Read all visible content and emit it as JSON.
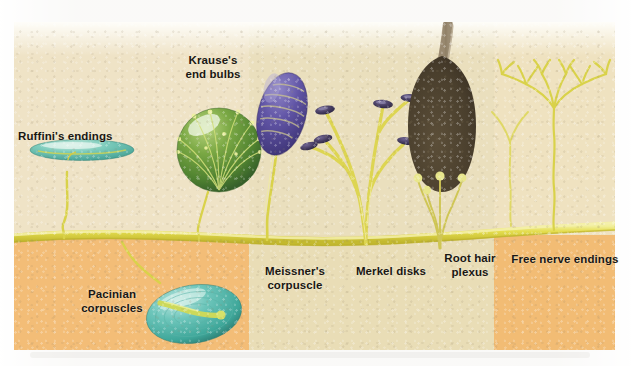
{
  "figure": {
    "colors": {
      "skin_upper_light": "#f0e4c6",
      "skin_upper_mid": "#e9dcb6",
      "skin_lower_orange": "#f2bd78",
      "skin_lower_cream": "#e8dcb4",
      "nerve_yellow": "#e2db4e",
      "nerve_yellow_light": "#ecea8a",
      "ruffini_teal": "#6fc3b4",
      "krause_green": "#5d8f34",
      "meissner_purple": "#5b4f9e",
      "merkel_disk": "#4a4166",
      "hair_brown": "#4b4030",
      "pacinian_teal": "#5cbcb0",
      "label_text": "#1a1713"
    },
    "bands": [
      {
        "name": "band-upper-left",
        "x": 0,
        "width": 235,
        "fill": "#efe3c6"
      },
      {
        "name": "band-upper-mid",
        "x": 235,
        "width": 245,
        "fill": "#eadfbd"
      },
      {
        "name": "band-upper-right",
        "x": 480,
        "width": 121,
        "fill": "#efe2c0"
      },
      {
        "name": "band-lower-orange-l",
        "x": 0,
        "width": 235,
        "fill": "#f3bd77"
      },
      {
        "name": "band-lower-cream",
        "x": 235,
        "width": 245,
        "fill": "#e9ddb6"
      },
      {
        "name": "band-lower-orange-r",
        "x": 480,
        "width": 121,
        "fill": "#f2bc74"
      }
    ],
    "labels": [
      {
        "id": "ruffini",
        "text": "Ruffini's endings",
        "x": 4,
        "y": 108,
        "width": 120,
        "align": "left"
      },
      {
        "id": "krause",
        "text": "Krause's\nend bulbs",
        "x": 152,
        "y": 36,
        "width": 110,
        "align": "center"
      },
      {
        "id": "pacinian",
        "text": "Pacinian\ncorpuscles",
        "x": 50,
        "y": 270,
        "width": 100,
        "align": "center"
      },
      {
        "id": "meissner",
        "text": "Meissner's\ncorpuscle",
        "x": 238,
        "y": 248,
        "width": 92,
        "align": "center"
      },
      {
        "id": "merkel",
        "text": "Merkel disks",
        "x": 335,
        "y": 248,
        "width": 92,
        "align": "center"
      },
      {
        "id": "roothair",
        "text": "Root hair\nplexus",
        "x": 420,
        "y": 237,
        "width": 84,
        "align": "center"
      },
      {
        "id": "freenerve",
        "text": "Free nerve endings",
        "x": 496,
        "y": 237,
        "width": 130,
        "align": "center"
      }
    ],
    "receptors": [
      {
        "id": "ruffini-ending",
        "name": "Ruffini's endings",
        "shape": "flattened-ellipse",
        "color": "#6fc3b4"
      },
      {
        "id": "krause-end-bulb",
        "name": "Krause's end bulbs",
        "shape": "sphere-coiled",
        "color": "#5d8f34"
      },
      {
        "id": "pacinian-corpuscle",
        "name": "Pacinian corpuscles",
        "shape": "onion-ellipse",
        "color": "#5cbcb0"
      },
      {
        "id": "meissner-corpuscle",
        "name": "Meissner's corpuscle",
        "shape": "ovoid-striated",
        "color": "#5b4f9e"
      },
      {
        "id": "merkel-disk",
        "name": "Merkel disks",
        "shape": "disk-on-stalk",
        "color": "#4a4166"
      },
      {
        "id": "root-hair-plexus",
        "name": "Root hair plexus",
        "shape": "hair-follicle",
        "color": "#4b4030"
      },
      {
        "id": "free-nerve-ending",
        "name": "Free nerve endings",
        "shape": "branching-tree",
        "color": "#d9d24a"
      }
    ],
    "nerve_trunk": {
      "name": "main nerve trunk",
      "orientation": "horizontal",
      "color": "#e2db4e"
    }
  }
}
